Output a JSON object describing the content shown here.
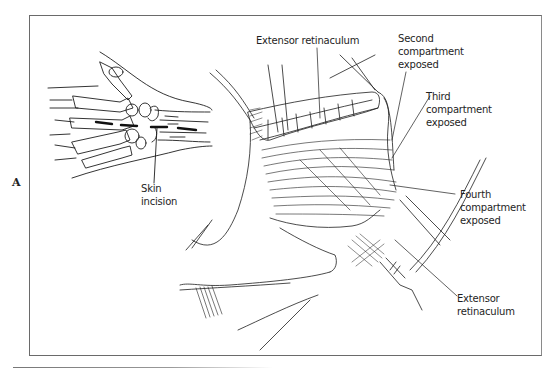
{
  "figure": {
    "panel_letter": "A",
    "inset": {
      "description": "dorsal wrist skeleton with dashed incision line",
      "label": [
        "Skin",
        "incision"
      ]
    },
    "labels": {
      "extensor_top": "Extensor retinaculum",
      "second": [
        "Second",
        "compartment",
        "exposed"
      ],
      "third": [
        "Third",
        "compartment",
        "exposed"
      ],
      "fourth": [
        "Fourth",
        "compartment",
        "exposed"
      ],
      "extensor_bottom": [
        "Extensor",
        "retinaculum"
      ]
    }
  },
  "colors": {
    "ink": "#1e1e1e",
    "frame": "#6a6a6a",
    "background": "#ffffff"
  }
}
